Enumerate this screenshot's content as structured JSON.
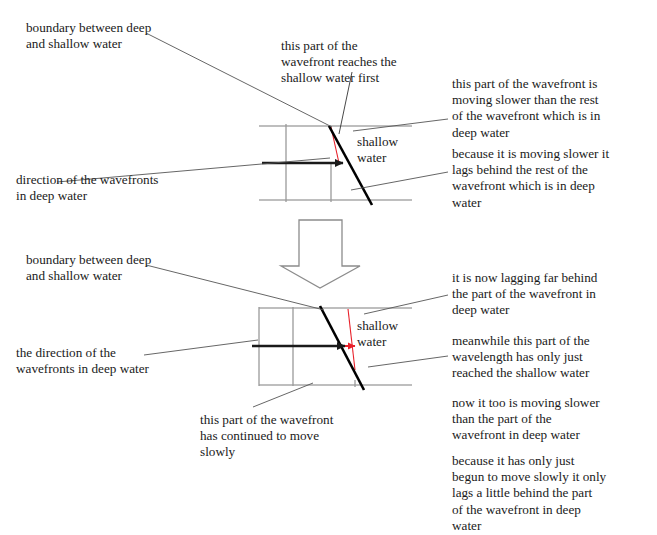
{
  "figure": {
    "title_present": false,
    "background_color": "#ffffff",
    "text_color": "#1a1a1a",
    "colors": {
      "boundary_line": "#a8a8a8",
      "deep_wavefront_line": "#9a9a9a",
      "refracted_wavefront": "#000000",
      "direction_arrow": "#1a1a1a",
      "leader_line": "#555555",
      "highlight": "#e8202a",
      "block_arrow_outline": "#8c8c8c"
    }
  },
  "top_panel": {
    "labels": {
      "boundary": "boundary between deep\nand shallow water",
      "direction": "direction of the wavefronts\nin deep water",
      "reaches_first": "this part of the\nwavefront reaches the\nshallow water first",
      "shallow_water": "shallow\nwater",
      "moving_slower": "this part of the wavefront is\nmoving slower than the rest\nof the wavefront which is in\ndeep water",
      "lags_behind": "because it is moving slower it\nlags behind the rest of the\nwavefront which is in deep\nwater"
    }
  },
  "transition": {
    "arrow_name": "down-block-arrow",
    "direction": "down"
  },
  "bottom_panel": {
    "labels": {
      "boundary": "boundary between deep\nand shallow water",
      "direction": "the direction of the\nwavefronts in deep water",
      "continued_slowly": "this part of the wavefront\nhas continued to move\nslowly",
      "shallow_water": "shallow\nwater",
      "lagging_far": "it is now lagging far behind\nthe part of the wavefront in\ndeep water",
      "meanwhile": "meanwhile this part of the\nwavelength has only just\nreached the shallow water",
      "now_too_slower": "now it too is moving slower\nthan the part of the\nwavefront in deep water",
      "lags_a_little": "because it has only just\nbegun to move slowly it only\nlags a little behind the part\nof the wavefront in deep\nwater"
    }
  }
}
